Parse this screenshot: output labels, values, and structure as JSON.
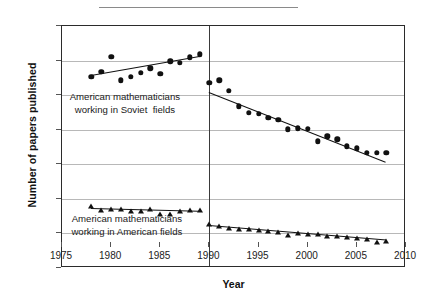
{
  "chart_data": {
    "type": "scatter",
    "title": "",
    "xlabel": "Year",
    "ylabel": "Number of papers published",
    "xlim": [
      1975,
      2010
    ],
    "ylim": [
      0.0,
      1.4
    ],
    "xticks": [
      1975,
      1980,
      1985,
      1990,
      1995,
      2000,
      2005,
      2010
    ],
    "yticks": [
      "0.0",
      "0.2",
      "0.4",
      "0.6",
      "0.8",
      "1.0",
      "1.2",
      "1.4"
    ],
    "grid": true,
    "legend_position": "inline-annotations",
    "divider_x": 1990,
    "series": [
      {
        "name": "American mathematicians working in Soviet  fields",
        "marker": "circle",
        "segment": "pre-1990",
        "x": [
          1978,
          1979,
          1980,
          1981,
          1982,
          1983,
          1984,
          1985,
          1986,
          1987,
          1988,
          1989
        ],
        "values": [
          1.105,
          1.135,
          1.222,
          1.085,
          1.105,
          1.128,
          1.155,
          1.122,
          1.196,
          1.187,
          1.218,
          1.237
        ],
        "trend": {
          "x": [
            1978,
            1989
          ],
          "y": [
            1.115,
            1.225
          ]
        }
      },
      {
        "name": "American mathematicians working in Soviet  fields",
        "marker": "circle",
        "segment": "post-1990",
        "x": [
          1990,
          1991,
          1992,
          1993,
          1994,
          1995,
          1996,
          1997,
          1998,
          1999,
          2000,
          2001,
          2002,
          2003,
          2004,
          2005,
          2006,
          2007,
          2008
        ],
        "values": [
          1.072,
          1.085,
          1.025,
          0.935,
          0.898,
          0.893,
          0.868,
          0.857,
          0.803,
          0.808,
          0.807,
          0.733,
          0.762,
          0.744,
          0.705,
          0.692,
          0.668,
          0.666,
          0.666
        ],
        "trend": {
          "x": [
            1990,
            2008
          ],
          "y": [
            1.018,
            0.614
          ]
        }
      },
      {
        "name": "American mathematicians working in American fields",
        "marker": "triangle",
        "segment": "pre-1990",
        "x": [
          1978,
          1979,
          1980,
          1981,
          1982,
          1983,
          1984,
          1985,
          1986,
          1987,
          1988,
          1989
        ],
        "values": [
          0.359,
          0.337,
          0.343,
          0.343,
          0.328,
          0.331,
          0.341,
          0.315,
          0.311,
          0.329,
          0.333,
          0.336
        ],
        "trend": {
          "x": [
            1978,
            1989
          ],
          "y": [
            0.349,
            0.333
          ]
        }
      },
      {
        "name": "American mathematicians working in American fields",
        "marker": "triangle",
        "segment": "post-1990",
        "x": [
          1990,
          1991,
          1992,
          1993,
          1994,
          1995,
          1996,
          1997,
          1998,
          1999,
          2000,
          2001,
          2002,
          2003,
          2004,
          2005,
          2006,
          2007,
          2008
        ],
        "values": [
          0.252,
          0.243,
          0.233,
          0.226,
          0.223,
          0.218,
          0.214,
          0.211,
          0.19,
          0.201,
          0.194,
          0.197,
          0.188,
          0.186,
          0.182,
          0.176,
          0.17,
          0.153,
          0.158
        ],
        "trend": {
          "x": [
            1990,
            2008
          ],
          "y": [
            0.247,
            0.163
          ]
        }
      }
    ],
    "annotations": [
      {
        "text": "American mathematicians\nworking in Soviet  fields",
        "x": 1981.4,
        "y": 0.95
      },
      {
        "text": "American mathematicians\nworking in American fields",
        "x": 1981.6,
        "y": 0.245
      }
    ]
  }
}
